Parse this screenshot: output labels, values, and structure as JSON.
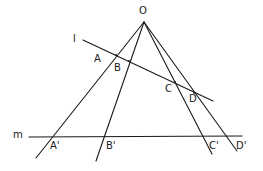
{
  "diagram": {
    "type": "projective-perspectivity",
    "background": "#ffffff",
    "stroke_color": "#1a1a1a",
    "center": {
      "label": "O",
      "x": 144,
      "y": 22,
      "label_x": 139,
      "label_y": 14
    },
    "lines": [
      {
        "id": "l",
        "label": "l",
        "x1": 83,
        "y1": 40,
        "x2": 213,
        "y2": 101,
        "label_x": 73,
        "label_y": 42
      },
      {
        "id": "m",
        "label": "m",
        "x1": 29,
        "y1": 137,
        "x2": 242,
        "y2": 136,
        "label_x": 13,
        "label_y": 138
      }
    ],
    "rays": [
      {
        "id": "OA",
        "x2": 36,
        "y2": 158
      },
      {
        "id": "OB",
        "x2": 96,
        "y2": 161
      },
      {
        "id": "OC",
        "x2": 212,
        "y2": 154
      },
      {
        "id": "OD",
        "x2": 237,
        "y2": 151
      }
    ],
    "points_on_l": [
      {
        "label": "A",
        "x": 116,
        "y": 55,
        "label_x": 94,
        "label_y": 62
      },
      {
        "label": "B",
        "x": 129,
        "y": 61,
        "label_x": 114,
        "label_y": 71
      },
      {
        "label": "C",
        "x": 175,
        "y": 82,
        "label_x": 165,
        "label_y": 92
      },
      {
        "label": "D",
        "x": 194,
        "y": 93,
        "label_x": 189,
        "label_y": 102
      }
    ],
    "points_on_m": [
      {
        "label": "A'",
        "x": 52,
        "y": 137,
        "label_x": 50,
        "label_y": 149
      },
      {
        "label": "B'",
        "x": 104,
        "y": 137,
        "label_x": 106,
        "label_y": 149
      },
      {
        "label": "C'",
        "x": 204,
        "y": 137,
        "label_x": 209,
        "label_y": 149
      },
      {
        "label": "D'",
        "x": 227,
        "y": 137,
        "label_x": 236,
        "label_y": 149
      }
    ]
  }
}
